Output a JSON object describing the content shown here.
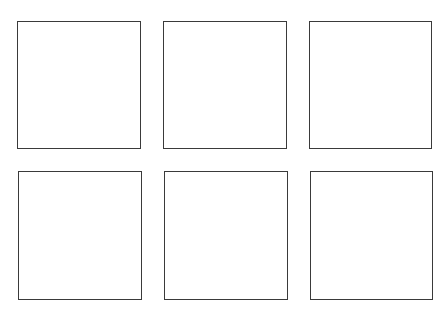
{
  "diagram": {
    "rows": 2,
    "columns": 3,
    "stroke_color": "#3a3a3a",
    "background_color": "#ffffff",
    "boxes": [
      {
        "row": 1,
        "col": 1,
        "x": 17,
        "y": 21,
        "w": 124,
        "h": 128
      },
      {
        "row": 1,
        "col": 2,
        "x": 163,
        "y": 21,
        "w": 124,
        "h": 128
      },
      {
        "row": 1,
        "col": 3,
        "x": 309,
        "y": 21,
        "w": 123,
        "h": 128
      },
      {
        "row": 2,
        "col": 1,
        "x": 18,
        "y": 171,
        "w": 124,
        "h": 129
      },
      {
        "row": 2,
        "col": 2,
        "x": 164,
        "y": 171,
        "w": 124,
        "h": 129
      },
      {
        "row": 2,
        "col": 3,
        "x": 310,
        "y": 171,
        "w": 123,
        "h": 129
      }
    ]
  }
}
